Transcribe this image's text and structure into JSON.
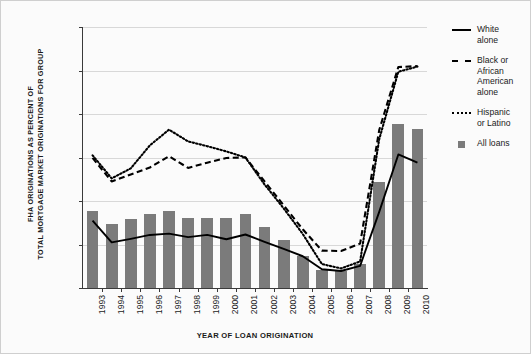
{
  "chart_data": {
    "type": "bar",
    "title": "",
    "xlabel": "YEAR OF LOAN ORIGINATION",
    "ylabel": "FHA ORIGINATIONS AS PERCENT OF TOTAL MORTGAGE MARKET ORIGINATIONS FOR GROUP",
    "ylabel_line1": "FHA ORIGINATIONS AS PERCENT OF",
    "ylabel_line2": "TOTAL MORTGAGE MARKET ORIGINATIONS FOR GROUP",
    "ylim": [
      0,
      60
    ],
    "ytick_labels": [
      "0%",
      "10%",
      "20%",
      "30%",
      "40%",
      "50%",
      "60%"
    ],
    "ytick_values": [
      0,
      10,
      20,
      30,
      40,
      50,
      60
    ],
    "grid": true,
    "legend_position": "right",
    "categories": [
      "1993",
      "1994",
      "1995",
      "1996",
      "1997",
      "1998",
      "1999",
      "2000",
      "2001",
      "2002",
      "2003",
      "2004",
      "2005",
      "2006",
      "2007",
      "2008",
      "2009",
      "2010"
    ],
    "series": [
      {
        "name": "All loans",
        "style": "bar",
        "color": "#7b7b7b",
        "values": [
          17.8,
          14.8,
          15.9,
          17.1,
          17.7,
          16.2,
          16.2,
          16.1,
          17.0,
          14.0,
          11.0,
          7.4,
          4.2,
          4.0,
          5.6,
          24.4,
          37.6,
          36.6
        ]
      },
      {
        "name": "White alone",
        "style": "solid-line",
        "color": "#000000",
        "values": [
          15.5,
          10.5,
          11.3,
          12.2,
          12.5,
          11.7,
          12.2,
          11.2,
          12.3,
          10.6,
          9.0,
          7.3,
          4.3,
          3.9,
          5.1,
          17.5,
          30.7,
          28.8
        ]
      },
      {
        "name": "Black or African American alone",
        "style": "dashed-line",
        "color": "#000000",
        "values": [
          29.9,
          24.5,
          26.1,
          27.7,
          30.3,
          27.6,
          28.8,
          29.9,
          30.0,
          24.5,
          19.0,
          13.5,
          8.6,
          8.5,
          10.2,
          36.3,
          50.8,
          51.0
        ]
      },
      {
        "name": "Hispanic or Latino",
        "style": "dotted-line",
        "color": "#000000",
        "values": [
          30.5,
          25.2,
          27.5,
          32.8,
          36.4,
          33.7,
          32.6,
          31.4,
          30.0,
          23.8,
          18.3,
          12.4,
          5.5,
          4.5,
          6.1,
          34.2,
          49.7,
          50.9
        ]
      }
    ]
  },
  "legend": {
    "items": [
      {
        "label_line1": "White",
        "label_line2": "alone",
        "label_line3": "",
        "label_line4": "",
        "key": "solid-line-key"
      },
      {
        "label_line1": "Black or",
        "label_line2": "African",
        "label_line3": "American",
        "label_line4": "alone",
        "key": "dashed-line-key"
      },
      {
        "label_line1": "Hispanic",
        "label_line2": "or Latino",
        "label_line3": "",
        "label_line4": "",
        "key": "dotted-line-key"
      },
      {
        "label_line1": "All loans",
        "label_line2": "",
        "label_line3": "",
        "label_line4": "",
        "key": "bar-swatch-key"
      }
    ]
  }
}
